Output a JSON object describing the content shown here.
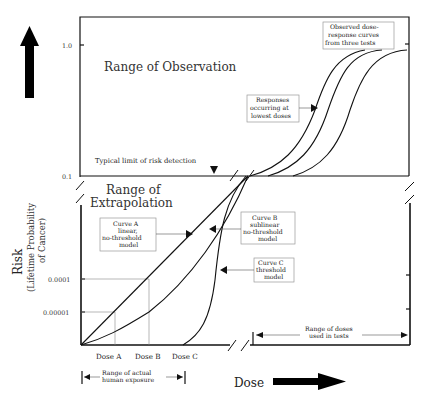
{
  "axes": {
    "y_label": "Risk",
    "y_sublabel_1": "(Lifetime Probability",
    "y_sublabel_2": "of Cancer)",
    "x_label": "Dose",
    "y_ticks": {
      "t1": "1.0",
      "t2": "0.1",
      "t3": "0.0001",
      "t4": "0.00001"
    }
  },
  "regions": {
    "observation": "Range of Observation",
    "extrapolation_1": "Range of",
    "extrapolation_2": "Extrapolation"
  },
  "annotations": {
    "detection_limit": "Typical limit of risk detection",
    "observed_1": "Observed dose-",
    "observed_2": "response curves",
    "observed_3": "from three tests",
    "lowest_1": "Responses",
    "lowest_2": "occurring at",
    "lowest_3": "lowest doses",
    "curveA_1": "Curve A",
    "curveA_2": "linear,",
    "curveA_3": "no-threshold",
    "curveA_4": "model",
    "curveB_1": "Curve B",
    "curveB_2": "sublinear",
    "curveB_3": "no-threshold",
    "curveB_4": "model",
    "curveC_1": "Curve C",
    "curveC_2": "threshold",
    "curveC_3": "model",
    "tests_range_1": "Range of doses",
    "tests_range_2": "used in tests",
    "human_range_1": "Range of actual",
    "human_range_2": "human exposure"
  },
  "doses": {
    "a": "Dose A",
    "b": "Dose B",
    "c": "Dose C"
  }
}
